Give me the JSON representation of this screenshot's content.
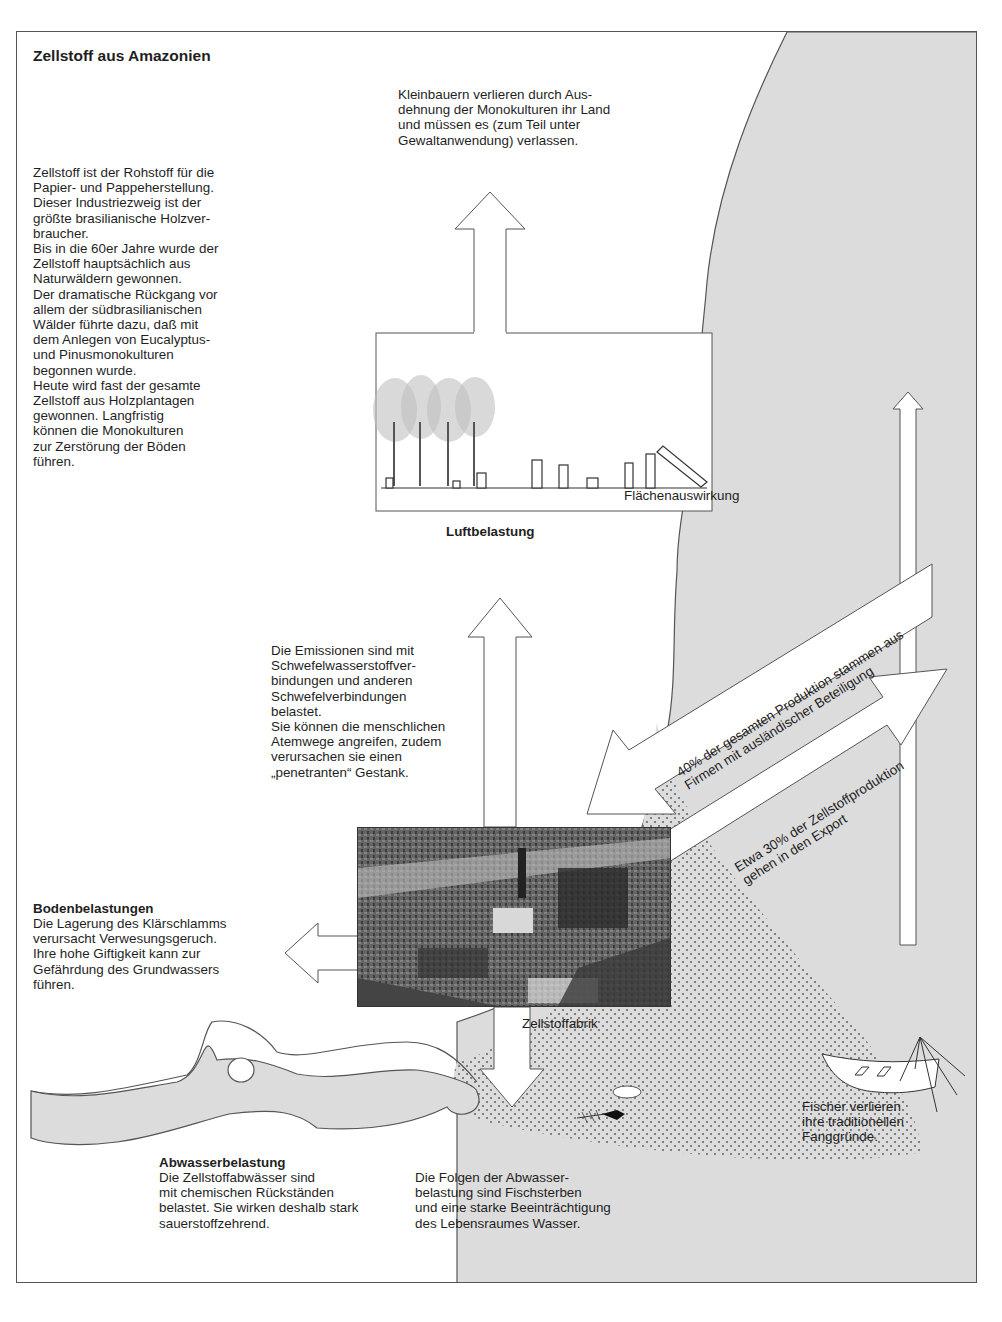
{
  "title": "Zellstoff aus Amazonien",
  "intro_text": "Zellstoff ist der Rohstoff für die\nPapier- und Pappeherstellung.\nDieser Industriezweig ist der\ngrößte brasilianische Holzver-\nbraucher.\nBis in die 60er Jahre wurde der\nZellstoff hauptsächlich aus\nNaturwäldern gewonnen.\nDer dramatische Rückgang vor\nallem der südbrasilianischen\nWälder führte dazu, daß mit\ndem Anlegen von Eucalyptus-\nund Pinusmonokulturen\nbegonnen wurde.\nHeute wird fast der gesamte\nZellstoff aus Holzplantagen\ngewonnen. Langfristig\nkönnen die Monokulturen\nzur Zerstörung der Böden\nführen.",
  "kleinbauern_text": "Kleinbauern verlieren durch Aus-\ndehnung der Monokulturen ihr Land\nund müssen es (zum Teil unter\nGewaltanwendung) verlassen.",
  "flaechen_label": "Flächenauswirkung",
  "luft": {
    "heading": "Luftbelastung",
    "text": "Die Emissionen sind mit\nSchwefelwasserstoffver-\nbindungen und anderen\nSchwefelverbindungen\nbelastet.\nSie können die menschlichen\nAtemwege angreifen, zudem\nverursachen sie einen\n„penetranten“ Gestank."
  },
  "foreign_arrow_text": "40% der gesamten Produktion stammen aus\nFirmen mit ausländischer Beteiligung",
  "export_arrow_text": "Etwa 30% der Zellstoffproduktion\ngehen in den Export",
  "boden": {
    "heading": "Bodenbelastungen",
    "text": "Die Lagerung des Klärschlamms\nverursacht Verwesungsgeruch.\nIhre hohe Giftigkeit kann zur\nGefährdung des Grundwassers\nführen."
  },
  "factory_label": "Zellstoffabrik",
  "fischer_text": "Fischer verlieren\nihre traditionellen\nFanggründe.",
  "abwasser": {
    "heading": "Abwasserbelastung",
    "text": "Die Zellstoffabwässer sind\nmit chemischen Rückständen\nbelastet. Sie wirken deshalb stark\nsauerstoffzehrend."
  },
  "folgen_text": "Die Folgen der Abwasser-\nbelastung sind Fischsterben\nund eine starke Beeinträchtigung\ndes Lebensraumes Wasser.",
  "colors": {
    "water": "#dcdcdc",
    "outline": "#555555",
    "text": "#1f1f1f"
  }
}
